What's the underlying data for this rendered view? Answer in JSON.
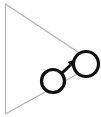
{
  "figure": {
    "title": "Two connected nodes inside a wedge outline",
    "type": "node-link-diagram",
    "width": 101,
    "height": 117,
    "background_color": "#ffffff"
  },
  "colors": {
    "background": "#ffffff",
    "wedge_stroke": "#b0b0b0",
    "node_stroke": "#111111",
    "node_fill": "#ffffff",
    "arrow_color": "#111111"
  },
  "wedge": {
    "name": "wedge-outline",
    "stroke_color": "#b0b0b0",
    "stroke_width": 1.2,
    "apex_label": "",
    "segments": [
      {
        "name": "left-vertical-edge",
        "x1": 5.5,
        "y1": 4,
        "x2": 5.5,
        "y2": 114
      },
      {
        "name": "upper-diagonal-edge",
        "x1": 5.5,
        "y1": 4,
        "x2": 99,
        "y2": 66
      },
      {
        "name": "lower-diagonal-edge",
        "x1": 5.5,
        "y1": 114,
        "x2": 99,
        "y2": 62
      }
    ]
  },
  "nodes": [
    {
      "id": "node-lower-left",
      "label": "",
      "cx": 53,
      "cy": 81,
      "r": 11.5,
      "stroke_width": 3.2
    },
    {
      "id": "node-upper-right",
      "label": "",
      "cx": 86,
      "cy": 64,
      "r": 12.5,
      "stroke_width": 3.2
    }
  ],
  "edges": [
    {
      "id": "edge-lower-to-upper",
      "from": "node-lower-left",
      "to": "node-upper-right",
      "label": "",
      "directed": true,
      "shaft": {
        "x1": 61.5,
        "y1": 73.5,
        "x2": 70.5,
        "y2": 65.0
      },
      "head": {
        "points": "75.5,59.5 67.5,62.0 72.5,67.0",
        "tip_x": 75.5,
        "tip_y": 59.5
      },
      "stroke_width": 3.0
    }
  ]
}
